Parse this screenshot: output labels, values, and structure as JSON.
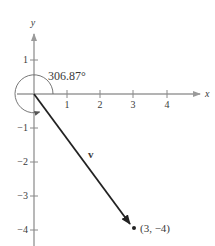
{
  "figure": {
    "angle_label": "306.87°",
    "vector_label": "v",
    "point_label": "(3,  −4)",
    "x_axis_label": "x",
    "y_axis_label": "y",
    "x_ticks": [
      {
        "value": 1,
        "label": "1"
      },
      {
        "value": 2,
        "label": "2"
      },
      {
        "value": 3,
        "label": "3"
      },
      {
        "value": 4,
        "label": "4"
      }
    ],
    "y_ticks": [
      {
        "value": 1,
        "label": "1"
      },
      {
        "value": -1,
        "label": "−1"
      },
      {
        "value": -2,
        "label": "−2"
      },
      {
        "value": -3,
        "label": "−3"
      },
      {
        "value": -4,
        "label": "−4"
      }
    ],
    "vector": {
      "from": [
        0,
        0
      ],
      "to": [
        3,
        -4
      ]
    },
    "angle_degrees": 306.87,
    "colors": {
      "axis": "#9a9a9a",
      "vector": "#222222",
      "text": "#3a3a3a"
    }
  }
}
